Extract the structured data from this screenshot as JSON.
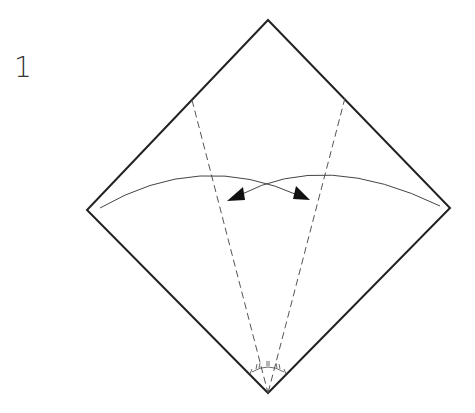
{
  "diagram": {
    "type": "origami-instruction",
    "step_number": "1",
    "colors": {
      "stroke": "#222222",
      "fold": "#555555",
      "background": "#ffffff"
    },
    "paper": {
      "shape": "square-as-diamond",
      "corners": {
        "top": [
          268,
          20
        ],
        "left": [
          87,
          210
        ],
        "right": [
          450,
          208
        ],
        "bottom": [
          268,
          393
        ]
      }
    },
    "fold_lines": [
      {
        "name": "valley-fold-left",
        "style": "dashed",
        "from": [
          192,
          100
        ],
        "to": [
          268,
          393
        ]
      },
      {
        "name": "valley-fold-right",
        "style": "dashed",
        "from": [
          345,
          98
        ],
        "to": [
          268,
          393
        ]
      }
    ],
    "arrows": [
      {
        "name": "fold-arrow-right-to-left",
        "description": "right edge folds in, arrow tip left"
      },
      {
        "name": "fold-arrow-left-to-right",
        "description": "left edge folds in, arrow tip right"
      }
    ],
    "angle_marks": {
      "description": "bottom angle divided into equal parts",
      "count": 4
    }
  }
}
